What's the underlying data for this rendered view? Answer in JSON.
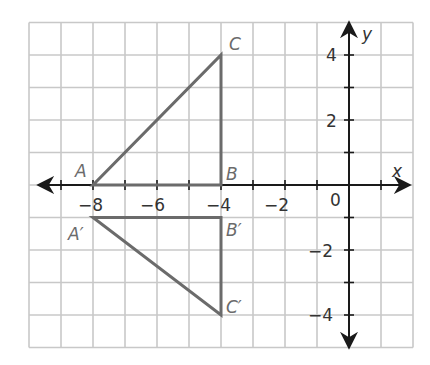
{
  "diagram": {
    "type": "coordinate-plane-reflection",
    "axes": {
      "x_label": "x",
      "y_label": "y",
      "x_range": [
        -10,
        2
      ],
      "y_range": [
        -5,
        5
      ],
      "origin_label": "0",
      "x_tick_labels": [
        "−8",
        "−6",
        "−4",
        "−2"
      ],
      "y_tick_labels": [
        "4",
        "2",
        "−2",
        "−4"
      ]
    },
    "triangles": [
      {
        "name": "ABC",
        "vertices": [
          {
            "label": "A",
            "x": -8,
            "y": 0
          },
          {
            "label": "B",
            "x": -4,
            "y": 0
          },
          {
            "label": "C",
            "x": -4,
            "y": 4
          }
        ]
      },
      {
        "name": "A'B'C'",
        "vertices": [
          {
            "label": "A′",
            "x": -8,
            "y": -1
          },
          {
            "label": "B′",
            "x": -4,
            "y": -1
          },
          {
            "label": "C′",
            "x": -4,
            "y": -4
          }
        ]
      }
    ],
    "colors": {
      "grid": "#c8c8c8",
      "axes": "#1a1a1a",
      "triangle": "#6b6b6b",
      "labels": "#6b6b6b"
    }
  }
}
